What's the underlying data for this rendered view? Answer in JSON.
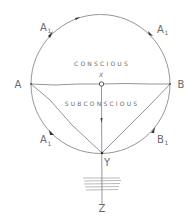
{
  "diagram": {
    "type": "hand-drawn circle diagram of conscious and subconscious mind",
    "colors": {
      "line": "#8a8a8a",
      "text": "#6a6a6a",
      "arrow": "#333333",
      "background": "#ffffff"
    },
    "regions": {
      "upper": "CONSCIOUS",
      "lower": "SUBCONSCIOUS"
    },
    "points": {
      "left": "A",
      "right": "B",
      "center": "X",
      "bottom": "Y",
      "below": "Z"
    },
    "arc_labels": {
      "top_left": {
        "main": "A",
        "sub": "1"
      },
      "top_right": {
        "main": "A",
        "sub": "1"
      },
      "bottom_left": {
        "main": "A",
        "sub": "1"
      },
      "bottom_right": {
        "main": "B",
        "sub": "1"
      }
    }
  }
}
